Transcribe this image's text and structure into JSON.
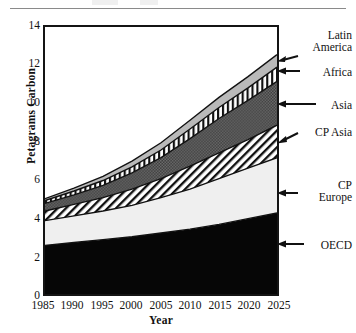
{
  "chart_data": {
    "type": "area",
    "title": "",
    "xlabel": "Year",
    "ylabel": "Petagrams Carbon",
    "xlim": [
      1985,
      2025
    ],
    "ylim": [
      0,
      14
    ],
    "grid": false,
    "stacked": true,
    "legend_position": "right-annotations",
    "x": [
      1985,
      1990,
      1995,
      2000,
      2005,
      2010,
      2015,
      2020,
      2025
    ],
    "x_tick_labels": [
      "1985",
      "1990",
      "1995",
      "2000",
      "2005",
      "2010",
      "2015",
      "2020",
      "2025"
    ],
    "y_tick_labels": [
      "0",
      "2",
      "4",
      "6",
      "8",
      "10",
      "12",
      "14"
    ],
    "y_major_ticks": [
      0,
      2,
      4,
      6,
      8,
      10,
      12,
      14
    ],
    "y_minor_ticks": [
      1,
      3,
      5,
      7,
      9,
      11,
      13
    ],
    "series": [
      {
        "name": "OECD",
        "fill": "solid-black",
        "color": "#060606",
        "values": [
          2.55,
          2.7,
          2.85,
          3.0,
          3.2,
          3.4,
          3.65,
          3.95,
          4.25
        ]
      },
      {
        "name": "CP Europe",
        "fill": "very-light-gray",
        "color": "#efefef",
        "values": [
          1.3,
          1.4,
          1.5,
          1.65,
          1.85,
          2.1,
          2.4,
          2.65,
          2.9
        ]
      },
      {
        "name": "CP Asia",
        "fill": "diagonal-hatch",
        "color": "#ffffff",
        "values": [
          0.5,
          0.6,
          0.7,
          0.85,
          1.0,
          1.2,
          1.35,
          1.5,
          1.7
        ]
      },
      {
        "name": "Asia",
        "fill": "dark-checker",
        "color": "#4a4a4a",
        "values": [
          0.4,
          0.5,
          0.65,
          0.85,
          1.1,
          1.45,
          1.8,
          2.05,
          2.3
        ]
      },
      {
        "name": "Africa",
        "fill": "vertical-stripe",
        "color": "#ffffff",
        "values": [
          0.15,
          0.2,
          0.25,
          0.32,
          0.4,
          0.5,
          0.58,
          0.66,
          0.75
        ]
      },
      {
        "name": "Latin America",
        "fill": "light-gray",
        "color": "#b9b9b9",
        "values": [
          0.1,
          0.15,
          0.22,
          0.3,
          0.38,
          0.46,
          0.53,
          0.59,
          0.65
        ]
      }
    ],
    "cumulative_totals": [
      5.0,
      5.55,
      6.17,
      6.97,
      7.93,
      9.11,
      10.31,
      11.4,
      12.55
    ]
  },
  "axes": {
    "y_title": "Petagrams Carbon",
    "x_title": "Year",
    "y_ticks": [
      {
        "value": 14,
        "label": "14"
      },
      {
        "value": 12,
        "label": "12"
      },
      {
        "value": 10,
        "label": "10"
      },
      {
        "value": 8,
        "label": "8"
      },
      {
        "value": 6,
        "label": "6"
      },
      {
        "value": 4,
        "label": "4"
      },
      {
        "value": 2,
        "label": "2"
      },
      {
        "value": 0,
        "label": "0"
      }
    ],
    "x_ticks": [
      {
        "value": 1985,
        "label": "1985"
      },
      {
        "value": 1990,
        "label": "1990"
      },
      {
        "value": 1995,
        "label": "1995"
      },
      {
        "value": 2000,
        "label": "2000"
      },
      {
        "value": 2005,
        "label": "2005"
      },
      {
        "value": 2010,
        "label": "2010"
      },
      {
        "value": 2015,
        "label": "2015"
      },
      {
        "value": 2020,
        "label": "2020"
      },
      {
        "value": 2025,
        "label": "2025"
      }
    ]
  },
  "annotations": [
    {
      "id": "latin-america",
      "line1": "Latin",
      "line2": "America"
    },
    {
      "id": "africa",
      "line1": "Africa",
      "line2": ""
    },
    {
      "id": "asia",
      "line1": "Asia",
      "line2": ""
    },
    {
      "id": "cp-asia",
      "line1": "CP  Asia",
      "line2": ""
    },
    {
      "id": "cp-europe",
      "line1": "CP",
      "line2": "Europe"
    },
    {
      "id": "oecd",
      "line1": "OECD",
      "line2": ""
    }
  ]
}
